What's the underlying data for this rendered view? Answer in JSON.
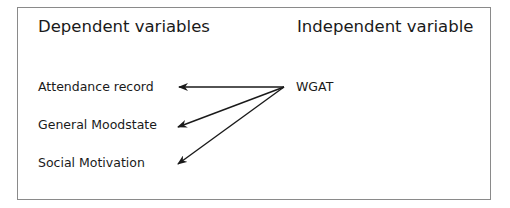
{
  "diagram": {
    "headings": {
      "dependent": "Dependent variables",
      "independent": "Independent variable"
    },
    "dependent_variables": [
      {
        "label": "Attendance record"
      },
      {
        "label": "General Moodstate"
      },
      {
        "label": "Social Motivation"
      }
    ],
    "independent_variable": {
      "label": "WGAT"
    },
    "edges": [
      {
        "from": "WGAT",
        "to": "Attendance record"
      },
      {
        "from": "WGAT",
        "to": "General Moodstate"
      },
      {
        "from": "WGAT",
        "to": "Social Motivation"
      }
    ],
    "colors": {
      "border": "#8a8a8a",
      "text": "#1a1a1a",
      "arrow": "#1a1a1a",
      "background": "#ffffff"
    }
  }
}
